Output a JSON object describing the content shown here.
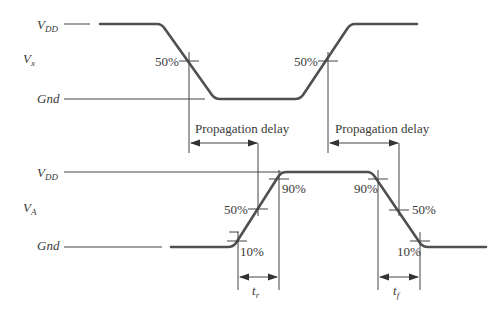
{
  "diagram": {
    "input_signal": {
      "name": "V",
      "subscript": "x",
      "vdd_label": "V",
      "vdd_subscript": "DD",
      "gnd_label": "Gnd",
      "crossings": [
        {
          "label": "50%"
        },
        {
          "label": "50%"
        }
      ]
    },
    "output_signal": {
      "name": "V",
      "subscript": "A",
      "vdd_label": "V",
      "vdd_subscript": "DD",
      "gnd_label": "Gnd",
      "rising_labels": {
        "p10": "10%",
        "p50": "50%",
        "p90": "90%"
      },
      "falling_labels": {
        "p90": "90%",
        "p50": "50%",
        "p10": "10%"
      }
    },
    "annotations": {
      "prop_delay_1": "Propagation delay",
      "prop_delay_2": "Propagation delay",
      "rise_time": {
        "symbol": "t",
        "subscript": "r"
      },
      "fall_time": {
        "symbol": "t",
        "subscript": "f"
      }
    },
    "colors": {
      "waveform": "#505050",
      "guide_lines": "#444444",
      "text": "#3a3a3a"
    }
  }
}
